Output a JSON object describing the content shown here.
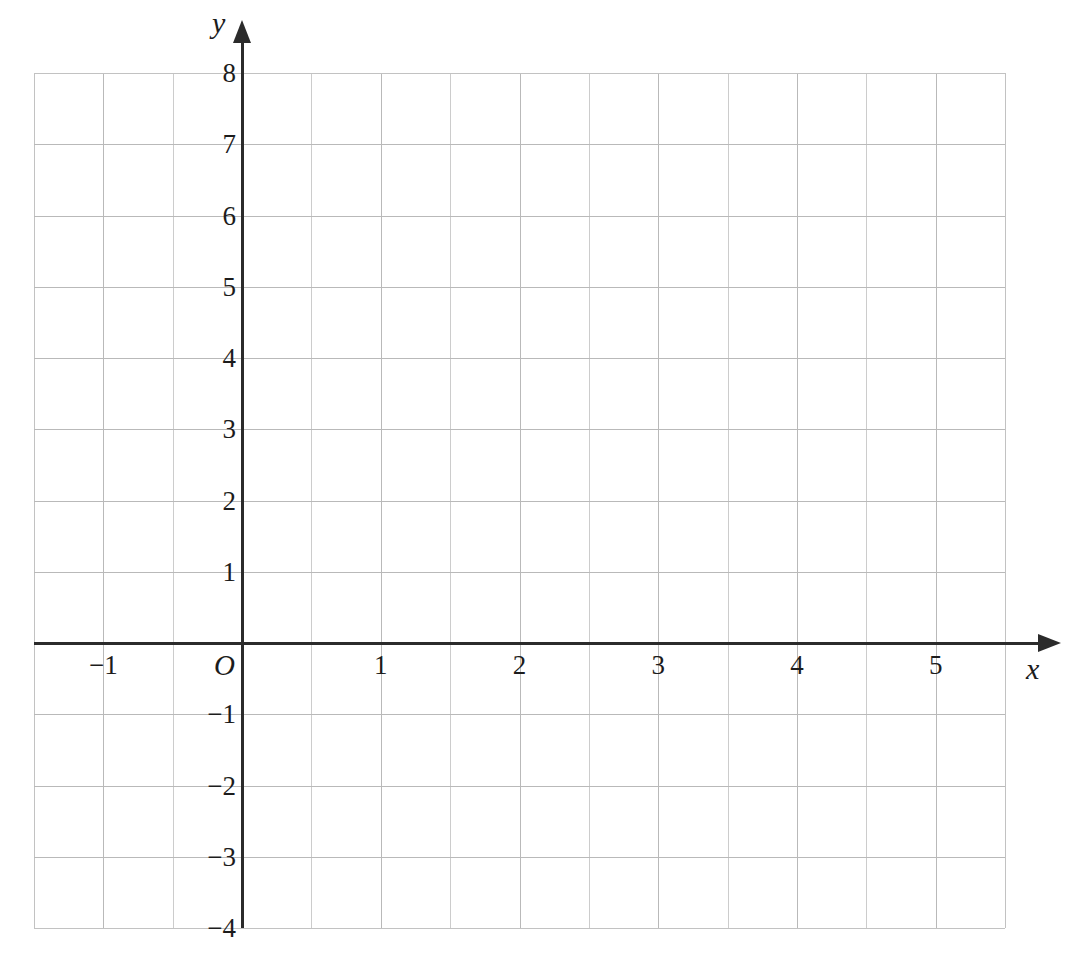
{
  "figure": {
    "kind": "cartesian-coordinate-grid",
    "background_color": "#ffffff",
    "axis_color": "#2b2b2b",
    "grid_color": "#b9b9b9",
    "minor_grid_color": "#cccccc"
  },
  "axes": {
    "x_axis_name": "x",
    "y_axis_name": "y",
    "origin_label": "O"
  },
  "chart_data": {
    "type": "scatter",
    "title": "",
    "subtitle": "",
    "xlabel": "x",
    "ylabel": "y",
    "origin_label": "O",
    "xlim": [
      -1.75,
      5.5
    ],
    "ylim": [
      -4,
      8
    ],
    "x_ticks": [
      -1,
      0,
      1,
      2,
      3,
      4,
      5
    ],
    "y_ticks": [
      -4,
      -3,
      -2,
      -1,
      0,
      1,
      2,
      3,
      4,
      5,
      6,
      7,
      8
    ],
    "x_tick_labels": [
      "−1",
      "O",
      "1",
      "2",
      "3",
      "4",
      "5"
    ],
    "y_tick_labels": [
      "−4",
      "−3",
      "−2",
      "−1",
      "1",
      "2",
      "3",
      "4",
      "5",
      "6",
      "7",
      "8"
    ],
    "x_major_step": 1,
    "y_major_step": 1,
    "grid": true,
    "grid_columns": 14,
    "grid_rows": 12,
    "legend": false,
    "legend_position": "none",
    "series": [],
    "annotations": []
  },
  "labels": {
    "x_ticks": [
      {
        "value": -1,
        "text": "−1"
      },
      {
        "value": 1,
        "text": "1"
      },
      {
        "value": 2,
        "text": "2"
      },
      {
        "value": 3,
        "text": "3"
      },
      {
        "value": 4,
        "text": "4"
      },
      {
        "value": 5,
        "text": "5"
      }
    ],
    "y_ticks": [
      {
        "value": 8,
        "text": "8"
      },
      {
        "value": 7,
        "text": "7"
      },
      {
        "value": 6,
        "text": "6"
      },
      {
        "value": 5,
        "text": "5"
      },
      {
        "value": 4,
        "text": "4"
      },
      {
        "value": 3,
        "text": "3"
      },
      {
        "value": 2,
        "text": "2"
      },
      {
        "value": 1,
        "text": "1"
      },
      {
        "value": -1,
        "text": "−1"
      },
      {
        "value": -2,
        "text": "−2"
      },
      {
        "value": -3,
        "text": "−3"
      },
      {
        "value": -4,
        "text": "−4"
      }
    ]
  }
}
